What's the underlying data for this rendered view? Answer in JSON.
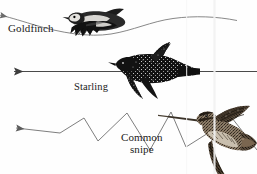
{
  "figure": {
    "background_color": "#fefefe",
    "ink_color": "#2b2b2b",
    "width": 257,
    "height": 174
  },
  "labels": {
    "goldfinch": "Goldfinch",
    "starling": "Starling",
    "snipe_line1": "Common",
    "snipe_line2": "snipe"
  },
  "birds": [
    {
      "name": "Goldfinch",
      "flight_path": "undulating",
      "path_direction": "leftward",
      "plumage": "black-and-white with pale breast"
    },
    {
      "name": "Starling",
      "flight_path": "straight",
      "path_direction": "leftward",
      "plumage": "dark silhouette"
    },
    {
      "name": "Common snipe",
      "flight_path": "zigzag",
      "path_direction": "leftward",
      "plumage": "mottled brown with long bill"
    }
  ],
  "artifacts": {
    "scan_seam_x": 214,
    "scan_seam_color": "#f0f0f0"
  }
}
